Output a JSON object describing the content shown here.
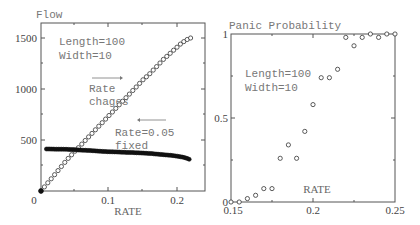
{
  "chart_data": [
    {
      "type": "scatter",
      "title": "",
      "ylabel": "Flow",
      "xlabel": "RATE",
      "xlim": [
        0,
        0.24
      ],
      "ylim": [
        0,
        1500
      ],
      "xticks": [
        "0",
        "0.1",
        "0.2"
      ],
      "yticks": [
        "0",
        "500",
        "1000",
        "1500"
      ],
      "grid": false,
      "annotations": [
        "Length=100",
        "Width=10",
        "Rate",
        "chages",
        "Rate=0.05",
        "fixed"
      ],
      "series": [
        {
          "name": "Rate changes",
          "marker": "open-circle",
          "x": [
            0.0,
            0.005,
            0.01,
            0.015,
            0.02,
            0.025,
            0.03,
            0.035,
            0.04,
            0.045,
            0.05,
            0.055,
            0.06,
            0.065,
            0.07,
            0.075,
            0.08,
            0.085,
            0.09,
            0.095,
            0.1,
            0.105,
            0.11,
            0.115,
            0.12,
            0.125,
            0.13,
            0.135,
            0.14,
            0.145,
            0.15,
            0.155,
            0.16,
            0.165,
            0.17,
            0.175,
            0.18,
            0.185,
            0.19,
            0.195,
            0.2,
            0.205,
            0.21,
            0.215,
            0.22
          ],
          "y": [
            0,
            40,
            80,
            120,
            160,
            200,
            240,
            280,
            320,
            355,
            390,
            425,
            460,
            495,
            530,
            565,
            600,
            635,
            670,
            705,
            740,
            775,
            810,
            845,
            880,
            915,
            950,
            985,
            1020,
            1055,
            1090,
            1120,
            1150,
            1185,
            1220,
            1255,
            1290,
            1320,
            1350,
            1380,
            1410,
            1440,
            1465,
            1485,
            1500
          ]
        },
        {
          "name": "Rate=0.05 fixed",
          "marker": "filled-circle",
          "x": [
            0.0,
            0.01,
            0.02,
            0.03,
            0.04,
            0.05,
            0.06,
            0.07,
            0.08,
            0.09,
            0.1,
            0.11,
            0.12,
            0.13,
            0.14,
            0.15,
            0.16,
            0.17,
            0.18,
            0.19,
            0.2,
            0.21,
            0.215,
            0.22
          ],
          "y": [
            0,
            412,
            410,
            410,
            408,
            405,
            400,
            398,
            393,
            388,
            385,
            383,
            380,
            378,
            375,
            372,
            368,
            362,
            356,
            350,
            342,
            330,
            320,
            305
          ]
        }
      ]
    },
    {
      "type": "scatter",
      "title": "",
      "ylabel": "Panic Probability",
      "xlabel": "RATE",
      "xlim": [
        0.15,
        0.25
      ],
      "ylim": [
        0,
        1
      ],
      "xticks": [
        "0.15",
        "0.2",
        "0.25"
      ],
      "yticks": [
        "0",
        "0.5",
        "1"
      ],
      "grid": false,
      "annotations": [
        "Length=100",
        "Width=10"
      ],
      "series": [
        {
          "name": "Panic probability",
          "marker": "open-circle",
          "x": [
            0.15,
            0.155,
            0.16,
            0.165,
            0.17,
            0.175,
            0.18,
            0.185,
            0.19,
            0.195,
            0.2,
            0.205,
            0.21,
            0.215,
            0.22,
            0.225,
            0.23,
            0.235,
            0.24,
            0.245,
            0.25
          ],
          "y": [
            0,
            0,
            0.02,
            0.04,
            0.08,
            0.08,
            0.26,
            0.34,
            0.26,
            0.42,
            0.58,
            0.74,
            0.74,
            0.79,
            0.98,
            0.93,
            0.98,
            1.0,
            0.98,
            1.0,
            1.0
          ]
        }
      ]
    }
  ],
  "left": {
    "ylabel": "Flow",
    "xlabel": "RATE",
    "yticks": [
      "0",
      "500",
      "1000",
      "1500"
    ],
    "xticks": [
      "0.1",
      "0.2"
    ],
    "zero": "0",
    "ann_length": "Length=100",
    "ann_width": "Width=10",
    "ann_rate": "Rate",
    "ann_chages": "chages",
    "ann_rate_fixed": "Rate=0.05",
    "ann_fixed": "fixed"
  },
  "right": {
    "ylabel": "Panic Probability",
    "xlabel": "RATE",
    "yticks": [
      "0",
      "0.5",
      "1"
    ],
    "xticks": [
      "0.15",
      "0.2",
      "0.25"
    ],
    "ann_length": "Length=100",
    "ann_width": "Width=10"
  }
}
